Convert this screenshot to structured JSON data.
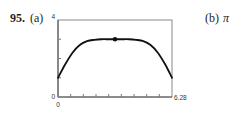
{
  "problem": {
    "number": "95.",
    "part_a_label": "(a)",
    "part_b_label": "(b)",
    "part_b_answer": "π"
  },
  "chart_data": {
    "type": "line",
    "title": "",
    "xlabel": "",
    "ylabel": "",
    "xlim": [
      0,
      6.28
    ],
    "ylim": [
      0,
      4
    ],
    "x_tick_labels": [
      "0",
      "6.28"
    ],
    "y_tick_labels": [
      "0",
      "4"
    ],
    "x_tick_count": 8,
    "y_ticks": [
      1,
      2,
      3
    ],
    "grid": false,
    "series": [
      {
        "name": "f(x)",
        "x": [
          0,
          0.4,
          0.8,
          1.2,
          1.6,
          2.0,
          2.4,
          2.8,
          3.14,
          3.5,
          3.9,
          4.3,
          4.7,
          5.1,
          5.5,
          5.9,
          6.28
        ],
        "values": [
          1.0,
          1.7,
          2.3,
          2.7,
          2.9,
          2.97,
          3.0,
          3.0,
          3.0,
          3.0,
          3.0,
          2.97,
          2.9,
          2.7,
          2.3,
          1.7,
          1.0
        ]
      }
    ],
    "marked_point": {
      "x": 3.14,
      "y": 3.0,
      "label": "maximum"
    }
  }
}
